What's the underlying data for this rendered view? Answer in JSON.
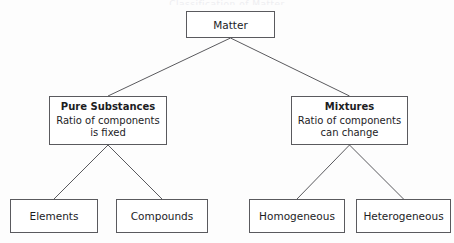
{
  "diagram": {
    "title_sliver": "Classification of Matter",
    "type": "tree",
    "colors": {
      "background": "#fdfdfd",
      "node_fill": "#ffffff",
      "node_border": "#5a5a5e",
      "text": "#1d1d1f",
      "connector": "#5a5a5e"
    },
    "nodes": {
      "root": {
        "label": "Matter"
      },
      "pure_substances": {
        "title": "Pure Substances",
        "detail_line_1": "Ratio of components",
        "detail_line_2": "is fixed"
      },
      "mixtures": {
        "title": "Mixtures",
        "detail_line_1": "Ratio of components",
        "detail_line_2": "can change"
      },
      "elements": {
        "label": "Elements"
      },
      "compounds": {
        "label": "Compounds"
      },
      "homogeneous": {
        "label": "Homogeneous"
      },
      "heterogeneous": {
        "label": "Heterogeneous"
      }
    },
    "edges": [
      {
        "name": "matter-to-pure-substances",
        "from": "root",
        "to": "pure_substances"
      },
      {
        "name": "matter-to-mixtures",
        "from": "root",
        "to": "mixtures"
      },
      {
        "name": "pure-substances-to-elements",
        "from": "pure_substances",
        "to": "elements"
      },
      {
        "name": "pure-substances-to-compounds",
        "from": "pure_substances",
        "to": "compounds"
      },
      {
        "name": "mixtures-to-homogeneous",
        "from": "mixtures",
        "to": "homogeneous"
      },
      {
        "name": "mixtures-to-heterogeneous",
        "from": "mixtures",
        "to": "heterogeneous"
      }
    ]
  }
}
